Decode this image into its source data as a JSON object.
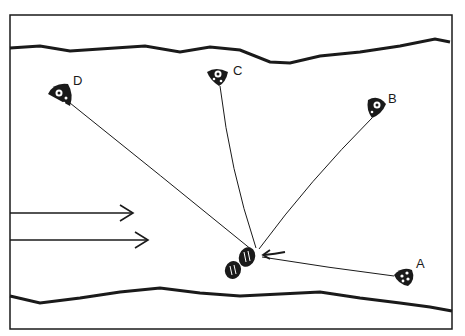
{
  "diagram": {
    "type": "schematic line drawing",
    "nodes": [
      {
        "label": "A",
        "x": 402,
        "y": 276
      },
      {
        "label": "B",
        "x": 376,
        "y": 106
      },
      {
        "label": "C",
        "x": 218,
        "y": 76
      },
      {
        "label": "D",
        "x": 62,
        "y": 96
      }
    ],
    "anchor_point": {
      "x": 256,
      "y": 252
    },
    "flow_arrows": 2,
    "stones": 2,
    "colors": {
      "ink": "#1a1a1a",
      "background": "#ffffff"
    }
  }
}
